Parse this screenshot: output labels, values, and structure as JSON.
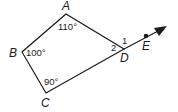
{
  "diagram": {
    "type": "quadrilateral-exterior-angle",
    "vertices": [
      {
        "id": "A",
        "label": "A",
        "x": 66,
        "y": 14
      },
      {
        "id": "B",
        "label": "B",
        "x": 22,
        "y": 52
      },
      {
        "id": "C",
        "label": "C",
        "x": 46,
        "y": 93
      },
      {
        "id": "D",
        "label": "D",
        "x": 124,
        "y": 49
      }
    ],
    "ray": {
      "from": "D",
      "through": "E",
      "point_label": "E",
      "point": {
        "x": 146,
        "y": 36
      },
      "tip": {
        "x": 167,
        "y": 26
      }
    },
    "angles": {
      "A": "110°",
      "B": "100°",
      "C": "90°",
      "angle1": "1",
      "angle2": "2"
    },
    "colors": {
      "stroke": "#1a1a1a",
      "background": "#ffffff"
    }
  }
}
